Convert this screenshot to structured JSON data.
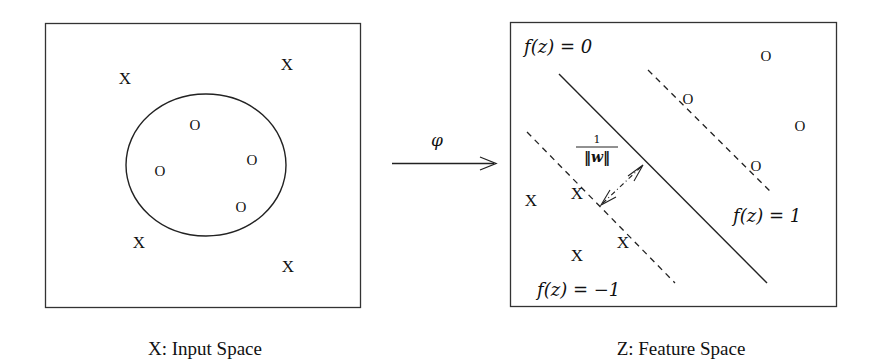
{
  "input_space": {
    "caption": "X: Input Space",
    "x_symbol": "X",
    "o_symbol": "O",
    "x_points": [
      [
        125,
        78
      ],
      [
        287,
        64
      ],
      [
        139,
        242
      ],
      [
        288,
        266
      ]
    ],
    "o_points": [
      [
        195,
        124
      ],
      [
        252,
        159
      ],
      [
        160,
        170
      ],
      [
        241,
        206
      ]
    ]
  },
  "mapping": {
    "label": "φ"
  },
  "feature_space": {
    "caption": "Z: Feature Space",
    "hyperplane_label": "f(z) = 0",
    "positive_margin_label": "f(z) = 1",
    "negative_margin_label": "f(z) = −1",
    "margin_numerator": "1",
    "margin_denominator": "‖w‖",
    "x_symbol": "X",
    "o_symbol": "O",
    "x_points": [
      [
        531,
        200
      ],
      [
        577,
        193
      ],
      [
        575,
        253
      ],
      [
        623,
        240
      ]
    ],
    "o_points": [
      [
        766,
        55
      ],
      [
        688,
        98
      ],
      [
        800,
        125
      ],
      [
        755,
        165
      ]
    ]
  }
}
